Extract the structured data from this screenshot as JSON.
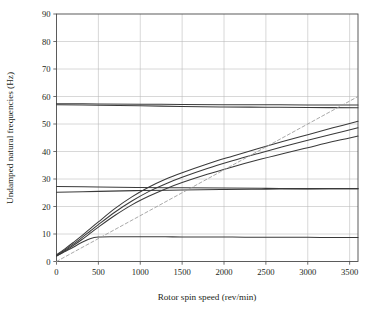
{
  "chart_data": {
    "type": "line",
    "title": "",
    "xlabel": "Rotor spin speed (rev/min)",
    "ylabel": "Undamped natural frequencies (Hz)",
    "xlim": [
      0,
      3600
    ],
    "ylim": [
      0,
      90
    ],
    "xticks": [
      0,
      500,
      1000,
      1500,
      2000,
      2500,
      3000,
      3500
    ],
    "xticklabels": [
      "0",
      "500",
      "1000",
      "1500",
      "2000",
      "2500",
      "3000",
      "3500"
    ],
    "yticks": [
      0,
      10,
      20,
      30,
      40,
      50,
      60,
      70,
      80,
      90
    ],
    "yticklabels": [
      "0",
      "10",
      "20",
      "30",
      "40",
      "50",
      "60",
      "70",
      "80",
      "90"
    ],
    "grid": true,
    "grid_color": "#b7b7b7",
    "frame_color": "#4a4a4a",
    "curve_color": "#3a3a3a",
    "excitation_color": "#9a9a9a",
    "legend": [],
    "annotations": [],
    "series": [
      {
        "name": "mode-1-backward",
        "style": "solid",
        "x": [
          0,
          100,
          200,
          300,
          400,
          500,
          700,
          900,
          1100,
          1300,
          1500,
          1800,
          2100,
          2400,
          2700,
          3000,
          3300,
          3600
        ],
        "y": [
          2.0,
          3.6,
          5.2,
          6.9,
          8.3,
          8.9,
          9.0,
          9.0,
          9.0,
          9.0,
          8.9,
          8.9,
          8.9,
          8.8,
          8.8,
          8.8,
          8.7,
          8.7
        ]
      },
      {
        "name": "mode-2-forward",
        "style": "solid",
        "x": [
          0,
          100,
          200,
          300,
          400,
          500,
          700,
          900,
          1100,
          1300,
          1500,
          1800,
          2100,
          2400,
          2700,
          3000,
          3300,
          3600
        ],
        "y": [
          2.0,
          3.8,
          5.8,
          7.9,
          10.2,
          12.5,
          16.8,
          20.6,
          23.7,
          26.4,
          28.7,
          31.7,
          34.4,
          36.9,
          39.2,
          41.4,
          43.6,
          45.6
        ]
      },
      {
        "name": "mode-3-forward",
        "style": "solid",
        "x": [
          0,
          100,
          200,
          300,
          400,
          500,
          700,
          900,
          1100,
          1300,
          1500,
          1800,
          2100,
          2400,
          2700,
          3000,
          3300,
          3600
        ],
        "y": [
          2.2,
          4.2,
          6.3,
          8.6,
          11.0,
          13.4,
          18.0,
          22.0,
          25.4,
          28.2,
          30.6,
          33.8,
          36.6,
          39.2,
          41.7,
          44.1,
          46.4,
          48.6
        ]
      },
      {
        "name": "mode-4-forward",
        "style": "solid",
        "x": [
          0,
          100,
          200,
          300,
          400,
          500,
          700,
          900,
          1100,
          1300,
          1500,
          1800,
          2100,
          2400,
          2700,
          3000,
          3300,
          3600
        ],
        "y": [
          2.4,
          4.6,
          6.9,
          9.3,
          11.9,
          14.4,
          19.3,
          23.5,
          27.0,
          29.9,
          32.3,
          35.5,
          38.3,
          41.0,
          43.6,
          46.1,
          48.6,
          51.0
        ]
      },
      {
        "name": "mode-5-near-26hz",
        "style": "solid",
        "x": [
          0,
          500,
          1000,
          1500,
          2000,
          2500,
          3000,
          3600
        ],
        "y": [
          25.2,
          25.5,
          25.8,
          26.0,
          26.2,
          26.3,
          26.4,
          26.5
        ]
      },
      {
        "name": "mode-6-near-27hz",
        "style": "solid",
        "x": [
          0,
          500,
          1000,
          1500,
          2000,
          2500,
          3000,
          3600
        ],
        "y": [
          27.3,
          27.1,
          26.9,
          26.8,
          26.7,
          26.6,
          26.5,
          26.5
        ]
      },
      {
        "name": "mode-7-near-57hz-upper",
        "style": "solid",
        "x": [
          0,
          500,
          1000,
          1500,
          2000,
          2500,
          3000,
          3600
        ],
        "y": [
          57.4,
          57.3,
          57.2,
          57.1,
          57.0,
          57.0,
          56.9,
          56.9
        ]
      },
      {
        "name": "mode-8-near-57hz-lower",
        "style": "solid",
        "x": [
          0,
          500,
          1000,
          1500,
          2000,
          2500,
          3000,
          3600
        ],
        "y": [
          57.0,
          56.8,
          56.6,
          56.4,
          56.2,
          56.1,
          56.0,
          55.9
        ]
      },
      {
        "name": "synchronous-1x-excitation",
        "style": "dashed",
        "x": [
          0,
          3600
        ],
        "y": [
          0,
          60
        ]
      }
    ]
  },
  "axes": {
    "xlabel": "Rotor spin speed (rev/min)",
    "ylabel": "Undamped natural frequencies (Hz)"
  }
}
